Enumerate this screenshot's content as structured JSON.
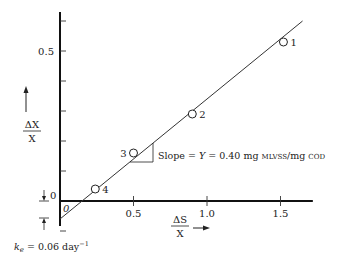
{
  "chart_data": {
    "type": "scatter",
    "title": "",
    "xlabel": "ΔS / X",
    "ylabel": "ΔX / X",
    "xlim": [
      -0.05,
      1.72
    ],
    "ylim": [
      -0.1,
      0.63
    ],
    "x_ticks": [
      0.5,
      1.0,
      1.5
    ],
    "x_tick_labels": [
      "0.5",
      "1.0",
      "1.5"
    ],
    "y_ticks": [
      -0.1,
      0.1,
      0.2,
      0.3,
      0.4,
      0.5,
      0.6
    ],
    "y_tick_labels": [
      {
        "value": 0.5,
        "label": "0.5"
      }
    ],
    "origin_label": "0",
    "y_zero_label": "0",
    "grid": false,
    "points": [
      {
        "label": "1",
        "x": 1.52,
        "y": 0.53
      },
      {
        "label": "2",
        "x": 0.9,
        "y": 0.29
      },
      {
        "label": "3",
        "x": 0.5,
        "y": 0.16
      },
      {
        "label": "4",
        "x": 0.24,
        "y": 0.04
      }
    ],
    "fit_line": {
      "slope": 0.4,
      "intercept": -0.06,
      "x_range": [
        0,
        1.65
      ]
    },
    "annotations": {
      "slope_prefix": "Slope = ",
      "slope_symbol": "Y",
      "slope_value": " = 0.40 mg ",
      "slope_unit1": "MLVSS",
      "slope_sep": "/mg ",
      "slope_unit2": "COD",
      "ke_symbol": "k",
      "ke_sub": "e",
      "ke_text": " = 0.06 day",
      "ke_exp": "−1"
    },
    "xlabel_num": "ΔS",
    "xlabel_den": "X",
    "ylabel_num": "ΔX",
    "ylabel_den": "X"
  }
}
